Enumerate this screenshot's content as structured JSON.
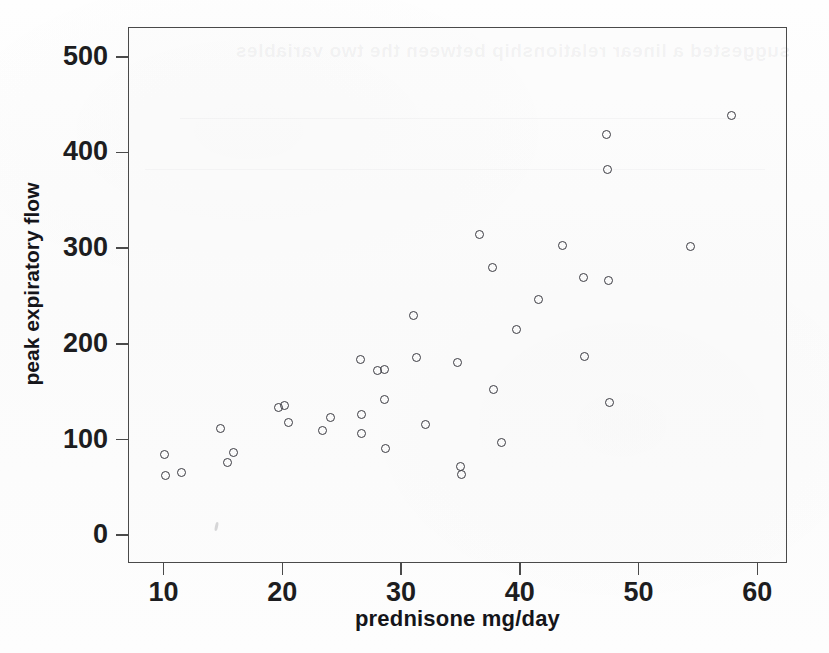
{
  "chart_data": {
    "type": "scatter",
    "title": "",
    "xlabel": "prednisone mg/day",
    "ylabel": "peak expiratory flow",
    "xlim": [
      7,
      62.5
    ],
    "ylim": [
      -30,
      530
    ],
    "xticks": [
      10,
      20,
      30,
      40,
      50,
      60
    ],
    "yticks": [
      0,
      100,
      200,
      300,
      400,
      500
    ],
    "grid": false,
    "legend": null,
    "marker": "open-circle",
    "marker_color": "#3b3b42",
    "points": [
      {
        "x": 10.0,
        "y": 84
      },
      {
        "x": 10.1,
        "y": 62
      },
      {
        "x": 11.4,
        "y": 66
      },
      {
        "x": 14.7,
        "y": 112
      },
      {
        "x": 15.3,
        "y": 76
      },
      {
        "x": 15.8,
        "y": 86
      },
      {
        "x": 19.6,
        "y": 134
      },
      {
        "x": 20.1,
        "y": 136
      },
      {
        "x": 20.4,
        "y": 118
      },
      {
        "x": 23.3,
        "y": 110
      },
      {
        "x": 24.0,
        "y": 123
      },
      {
        "x": 26.5,
        "y": 184
      },
      {
        "x": 26.6,
        "y": 126
      },
      {
        "x": 26.6,
        "y": 106
      },
      {
        "x": 27.9,
        "y": 172
      },
      {
        "x": 28.5,
        "y": 173
      },
      {
        "x": 28.5,
        "y": 142
      },
      {
        "x": 28.6,
        "y": 91
      },
      {
        "x": 31.0,
        "y": 230
      },
      {
        "x": 31.2,
        "y": 186
      },
      {
        "x": 32.0,
        "y": 116
      },
      {
        "x": 34.7,
        "y": 181
      },
      {
        "x": 34.9,
        "y": 72
      },
      {
        "x": 35.0,
        "y": 63
      },
      {
        "x": 36.5,
        "y": 314
      },
      {
        "x": 37.6,
        "y": 280
      },
      {
        "x": 37.7,
        "y": 152
      },
      {
        "x": 38.4,
        "y": 97
      },
      {
        "x": 39.6,
        "y": 215
      },
      {
        "x": 41.5,
        "y": 246
      },
      {
        "x": 43.5,
        "y": 303
      },
      {
        "x": 45.3,
        "y": 269
      },
      {
        "x": 45.4,
        "y": 187
      },
      {
        "x": 47.2,
        "y": 419
      },
      {
        "x": 47.3,
        "y": 382
      },
      {
        "x": 47.4,
        "y": 266
      },
      {
        "x": 47.5,
        "y": 139
      },
      {
        "x": 54.3,
        "y": 302
      },
      {
        "x": 57.7,
        "y": 439
      }
    ]
  },
  "ghost": {
    "bleed_text": "suggested a linear relationship between the two variables"
  }
}
